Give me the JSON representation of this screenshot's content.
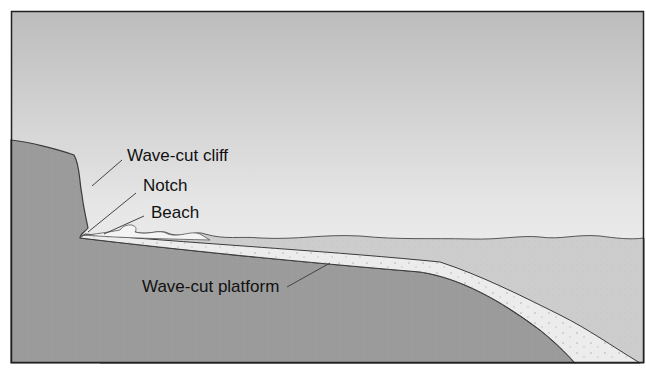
{
  "diagram": {
    "labels": {
      "cliff": "Wave-cut cliff",
      "notch": "Notch",
      "beach": "Beach",
      "platform": "Wave-cut platform"
    },
    "colors": {
      "sky_top": "#bdbdbd",
      "sky_bottom": "#f4f4f4",
      "rock": "#9a9a9a",
      "water": "#cfcfcf",
      "platform_sediment": "#ececec",
      "outline": "#3a3a3a",
      "frame": "#222222"
    }
  }
}
